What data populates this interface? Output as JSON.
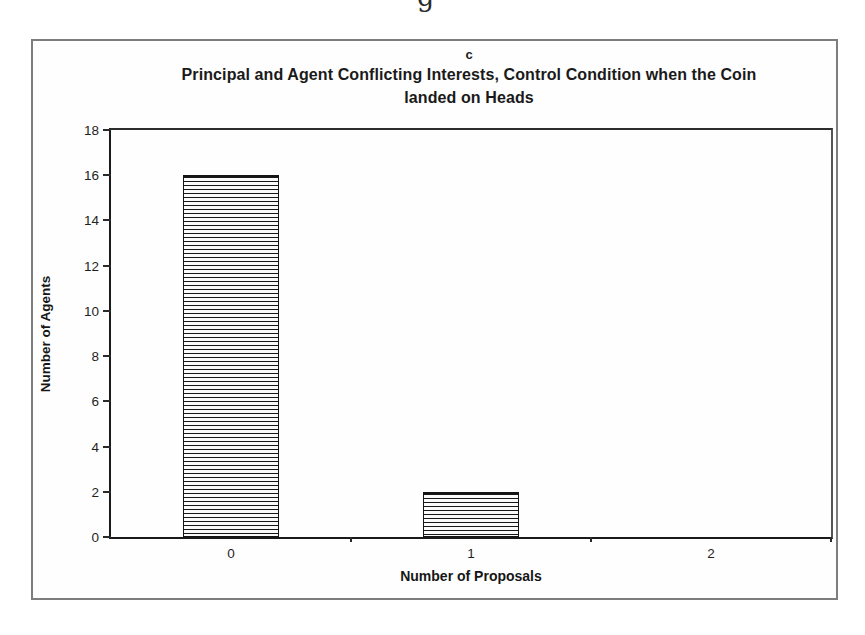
{
  "figure": {
    "top_text_fragment": "g"
  },
  "chart_data": {
    "type": "bar",
    "panel_label": "c",
    "title": "Principal and Agent Conflicting Interests, Control Condition when the Coin landed on Heads",
    "title_line1": "Principal and Agent Conflicting Interests, Control Condition when the Coin",
    "title_line2": "landed on Heads",
    "categories": [
      "0",
      "1",
      "2"
    ],
    "values": [
      16,
      2,
      0
    ],
    "xlabel": "Number of Proposals",
    "ylabel": "Number of Agents",
    "ylim": [
      0,
      18
    ],
    "y_ticks": [
      0,
      2,
      4,
      6,
      8,
      10,
      12,
      14,
      16,
      18
    ],
    "grid": "off",
    "legend": "none",
    "bar_fill": "horizontal-line-hatch",
    "ink_color": "#1a1a1a",
    "background": "#ffffff"
  }
}
